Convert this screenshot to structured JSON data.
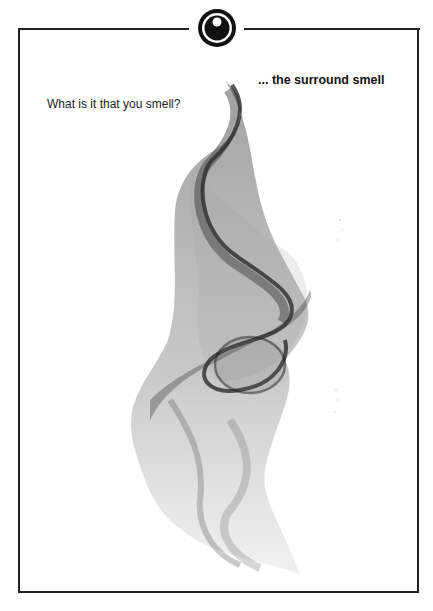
{
  "poster": {
    "question": "What is it that you smell?",
    "tagline": "... the surround smell",
    "emblem": "eye-icon",
    "colors": {
      "frame": "#222222",
      "background": "#ffffff",
      "smoke": "#3a3a3a"
    }
  }
}
